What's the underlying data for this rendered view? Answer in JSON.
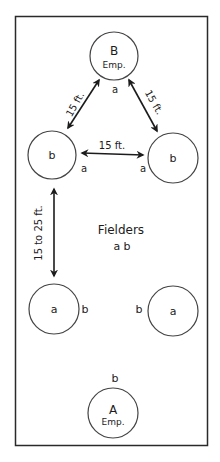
{
  "diagram": {
    "top_station": {
      "letter": "B",
      "sub": "Emp.",
      "pos_label": "a"
    },
    "bottom_station": {
      "letter": "A",
      "sub": "Emp.",
      "pos_label": "b"
    },
    "left_upper": {
      "letter": "b",
      "pos_label": "a"
    },
    "right_upper": {
      "letter": "b",
      "pos_label": "a"
    },
    "left_lower": {
      "letter": "a",
      "pos_label": "b"
    },
    "right_lower": {
      "letter": "a",
      "pos_label": "b"
    },
    "distances": {
      "top_left": "15 ft.",
      "top_right": "15 ft.",
      "horizontal": "15 ft.",
      "vertical": "15 to 25 ft."
    },
    "center_label": {
      "title": "Fielders",
      "sub": "a b"
    }
  }
}
